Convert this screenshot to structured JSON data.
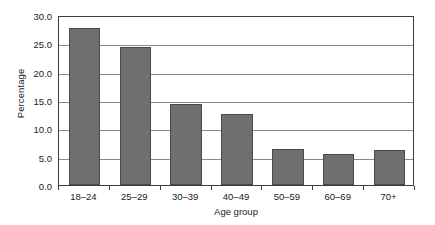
{
  "chart_data": {
    "type": "bar",
    "title": "",
    "xlabel": "Age group",
    "ylabel": "Percentage",
    "categories": [
      "18–24",
      "25–29",
      "30–39",
      "40–49",
      "50–59",
      "60–69",
      "70+"
    ],
    "values": [
      27.7,
      24.3,
      14.3,
      12.6,
      6.4,
      5.5,
      6.2
    ],
    "ylim": [
      0.0,
      30.0
    ],
    "ytick_values": [
      0.0,
      5.0,
      10.0,
      15.0,
      20.0,
      25.0,
      30.0
    ],
    "ytick_labels": [
      "0.0",
      "5.0",
      "10.0",
      "15.0",
      "20.0",
      "25.0",
      "30.0"
    ],
    "grid": "horizontal",
    "legend": "none",
    "bar_color": "#6f6f6f",
    "bar_edge_color": "#4a4a4a",
    "grid_color": "#8a8a8a",
    "frame_color": "#3c3c3c",
    "background_color": "#ffffff"
  }
}
